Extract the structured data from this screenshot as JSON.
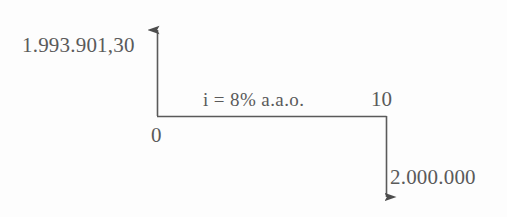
{
  "diagram": {
    "type": "cash-flow-timeline",
    "title": "",
    "stroke_color": "#5a5a5a",
    "background_color": "#fdfdfd",
    "text_color": "#5a5a5a",
    "labels": {
      "present_value": "1.993.901,30",
      "origin": "0",
      "interest_rate": "i = 8% a.a.o.",
      "period": "10",
      "future_value": "2.000.000"
    },
    "axes": {
      "vertical_arrow_direction": "up",
      "vertical_arrow_meaning": "inflow-present-value",
      "horizontal_line_meaning": "time-axis",
      "outflow_arrow_direction": "down",
      "outflow_arrow_meaning": "outflow-future-value"
    },
    "geometry": {
      "origin_x": 157,
      "origin_y": 116,
      "axis_top_y": 22,
      "period_end_x": 386,
      "outflow_end_y": 207
    }
  }
}
